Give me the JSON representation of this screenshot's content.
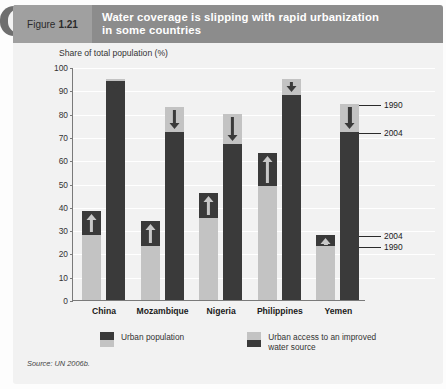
{
  "figure": {
    "label": "Figure",
    "number": "1.21",
    "title": "Water coverage is slipping with rapid urbanization in some countries",
    "title_line1": "Water coverage is slipping with rapid urbanization",
    "title_line2": "in some countries",
    "source": "Source: UN 2006b."
  },
  "legend": [
    {
      "name": "urban-population",
      "label": "Urban population",
      "top_color": "#3a3a3a",
      "bottom_color": "#c3c3c3"
    },
    {
      "name": "urban-water-access",
      "label": "Urban access to an improved water source",
      "label_line1": "Urban access to an improved",
      "label_line2": "water source",
      "top_color": "#c3c3c3",
      "bottom_color": "#3a3a3a"
    }
  ],
  "annotations": [
    {
      "id": "water-1990",
      "text": "1990",
      "value": 84
    },
    {
      "id": "water-2004",
      "text": "2004",
      "value": 72
    },
    {
      "id": "pop-2004",
      "text": "2004",
      "value": 28
    },
    {
      "id": "pop-1990",
      "text": "1990",
      "value": 23
    }
  ],
  "colors": {
    "light_gray": "#c3c3c3",
    "dark_gray": "#3a3a3a",
    "header_band": "#8c8c8c",
    "figure_tag": "#a0a0a0",
    "panel": "#f2f2f2"
  },
  "chart_data": {
    "type": "bar",
    "title": "Water coverage is slipping with rapid urbanization in some countries",
    "subtitle": "",
    "xlabel": "",
    "ylabel": "Share of total population (%)",
    "ylim": [
      0,
      100
    ],
    "yticks": [
      0,
      10,
      20,
      30,
      40,
      50,
      60,
      70,
      80,
      90,
      100
    ],
    "grid": true,
    "legend_position": "bottom",
    "categories": [
      "China",
      "Mozambique",
      "Nigeria",
      "Philippines",
      "Yemen"
    ],
    "series": [
      {
        "name": "Urban population",
        "years": [
          "1990",
          "2004"
        ],
        "values_1990": [
          28,
          23,
          35,
          49,
          23
        ],
        "values_2004": [
          38,
          34,
          46,
          63,
          28
        ],
        "direction": [
          "up",
          "up",
          "up",
          "up",
          "up"
        ]
      },
      {
        "name": "Urban access to an improved water source",
        "years": [
          "1990",
          "2004"
        ],
        "values_1990": [
          95,
          83,
          80,
          95,
          84
        ],
        "values_2004": [
          94,
          72,
          67,
          88,
          72
        ],
        "direction": [
          "down",
          "down",
          "down",
          "down",
          "down"
        ]
      }
    ]
  }
}
